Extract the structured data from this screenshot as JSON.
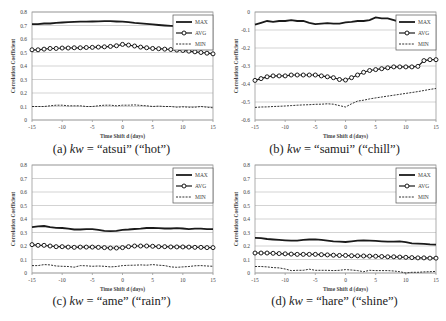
{
  "chart_data": [
    {
      "id": "a",
      "type": "line",
      "caption_prefix": "(a) ",
      "caption_kw": "kw",
      "caption_suffix": " = “atsui” (“hot”)",
      "xlabel": "Time Shift d (days)",
      "ylabel": "Correlation Coefficient",
      "ylim": [
        0,
        0.8
      ],
      "yticks": [
        "0",
        "0.1",
        "0.2",
        "0.3",
        "0.4",
        "0.5",
        "0.6",
        "0.7",
        "0.8"
      ],
      "xlim": [
        -15,
        15
      ],
      "xticks": [
        "-15",
        "-10",
        "-5",
        "0",
        "5",
        "10",
        "15"
      ],
      "legend": [
        "MAX",
        "AVG",
        "MIN"
      ],
      "x": [
        -15,
        -14,
        -13,
        -12,
        -11,
        -10,
        -9,
        -8,
        -7,
        -6,
        -5,
        -4,
        -3,
        -2,
        -1,
        0,
        1,
        2,
        3,
        4,
        5,
        6,
        7,
        8,
        9,
        10,
        11,
        12,
        13,
        14,
        15
      ],
      "series": [
        {
          "name": "MAX",
          "values": [
            0.71,
            0.71,
            0.715,
            0.715,
            0.72,
            0.722,
            0.725,
            0.727,
            0.728,
            0.729,
            0.73,
            0.731,
            0.732,
            0.732,
            0.73,
            0.728,
            0.725,
            0.72,
            0.716,
            0.712,
            0.708,
            0.704,
            0.7,
            0.697,
            0.695,
            0.695,
            0.69,
            0.685,
            0.68,
            0.675,
            0.67
          ]
        },
        {
          "name": "AVG",
          "values": [
            0.52,
            0.52,
            0.525,
            0.53,
            0.53,
            0.533,
            0.533,
            0.535,
            0.535,
            0.537,
            0.538,
            0.54,
            0.542,
            0.545,
            0.55,
            0.56,
            0.555,
            0.548,
            0.54,
            0.535,
            0.53,
            0.528,
            0.525,
            0.522,
            0.518,
            0.515,
            0.51,
            0.505,
            0.5,
            0.495,
            0.49
          ]
        },
        {
          "name": "MIN",
          "values": [
            0.1,
            0.1,
            0.1,
            0.105,
            0.11,
            0.11,
            0.105,
            0.105,
            0.105,
            0.1,
            0.1,
            0.105,
            0.11,
            0.11,
            0.105,
            0.11,
            0.11,
            0.112,
            0.108,
            0.105,
            0.1,
            0.103,
            0.1,
            0.1,
            0.095,
            0.098,
            0.095,
            0.095,
            0.1,
            0.095,
            0.09
          ]
        }
      ]
    },
    {
      "id": "b",
      "type": "line",
      "caption_prefix": "(b) ",
      "caption_kw": "kw",
      "caption_suffix": " = “samui” (“chill”)",
      "xlabel": "Time Shift d (days)",
      "ylabel": "Correlation Coefficient",
      "ylim": [
        -0.6,
        0
      ],
      "yticks": [
        "-0.6",
        "-0.5",
        "-0.4",
        "-0.3",
        "-0.2",
        "-0.1",
        "0"
      ],
      "xlim": [
        -15,
        15
      ],
      "xticks": [
        "-15",
        "-10",
        "-5",
        "0",
        "5",
        "10",
        "15"
      ],
      "legend": [
        "MAX",
        "AVG",
        "MIN"
      ],
      "x": [
        -15,
        -14,
        -13,
        -12,
        -11,
        -10,
        -9,
        -8,
        -7,
        -6,
        -5,
        -4,
        -3,
        -2,
        -1,
        0,
        1,
        2,
        3,
        4,
        5,
        6,
        7,
        8,
        9,
        10,
        11,
        12,
        13,
        14,
        15
      ],
      "series": [
        {
          "name": "MAX",
          "values": [
            -0.07,
            -0.06,
            -0.05,
            -0.055,
            -0.05,
            -0.05,
            -0.045,
            -0.05,
            -0.05,
            -0.06,
            -0.068,
            -0.065,
            -0.062,
            -0.065,
            -0.065,
            -0.058,
            -0.055,
            -0.05,
            -0.05,
            -0.045,
            -0.03,
            -0.035,
            -0.035,
            -0.045,
            -0.055,
            -0.05,
            -0.05,
            -0.045,
            -0.04,
            -0.04,
            -0.04
          ]
        },
        {
          "name": "AVG",
          "values": [
            -0.38,
            -0.37,
            -0.36,
            -0.355,
            -0.355,
            -0.355,
            -0.35,
            -0.35,
            -0.35,
            -0.35,
            -0.35,
            -0.355,
            -0.36,
            -0.365,
            -0.375,
            -0.378,
            -0.365,
            -0.35,
            -0.335,
            -0.325,
            -0.32,
            -0.315,
            -0.31,
            -0.305,
            -0.305,
            -0.305,
            -0.305,
            -0.302,
            -0.27,
            -0.265,
            -0.265
          ]
        },
        {
          "name": "MIN",
          "values": [
            -0.53,
            -0.528,
            -0.527,
            -0.525,
            -0.524,
            -0.522,
            -0.52,
            -0.518,
            -0.516,
            -0.515,
            -0.513,
            -0.512,
            -0.51,
            -0.512,
            -0.52,
            -0.528,
            -0.51,
            -0.495,
            -0.49,
            -0.483,
            -0.477,
            -0.472,
            -0.467,
            -0.462,
            -0.457,
            -0.452,
            -0.447,
            -0.442,
            -0.436,
            -0.43,
            -0.425
          ]
        }
      ]
    },
    {
      "id": "c",
      "type": "line",
      "caption_prefix": "(c) ",
      "caption_kw": "kw",
      "caption_suffix": " = “ame” (“rain”)",
      "xlabel": "Time Shift d (days)",
      "ylabel": "Correlation Coefficient",
      "ylim": [
        0,
        0.8
      ],
      "yticks": [
        "0",
        "0.1",
        "0.2",
        "0.3",
        "0.4",
        "0.5",
        "0.6",
        "0.7",
        "0.8"
      ],
      "xlim": [
        -15,
        15
      ],
      "xticks": [
        "-15",
        "-10",
        "-5",
        "0",
        "5",
        "10",
        "15"
      ],
      "legend": [
        "MAX",
        "AVG",
        "MIN"
      ],
      "x": [
        -15,
        -14,
        -13,
        -12,
        -11,
        -10,
        -9,
        -8,
        -7,
        -6,
        -5,
        -4,
        -3,
        -2,
        -1,
        0,
        1,
        2,
        3,
        4,
        5,
        6,
        7,
        8,
        9,
        10,
        11,
        12,
        13,
        14,
        15
      ],
      "series": [
        {
          "name": "MAX",
          "values": [
            0.34,
            0.345,
            0.348,
            0.34,
            0.335,
            0.333,
            0.328,
            0.322,
            0.322,
            0.325,
            0.325,
            0.32,
            0.312,
            0.31,
            0.312,
            0.32,
            0.322,
            0.326,
            0.328,
            0.333,
            0.335,
            0.332,
            0.33,
            0.33,
            0.332,
            0.33,
            0.325,
            0.328,
            0.328,
            0.325,
            0.325
          ]
        },
        {
          "name": "AVG",
          "values": [
            0.21,
            0.205,
            0.205,
            0.2,
            0.195,
            0.195,
            0.192,
            0.19,
            0.192,
            0.192,
            0.192,
            0.19,
            0.188,
            0.185,
            0.185,
            0.188,
            0.195,
            0.2,
            0.2,
            0.2,
            0.198,
            0.195,
            0.195,
            0.193,
            0.193,
            0.193,
            0.192,
            0.19,
            0.19,
            0.188,
            0.188
          ]
        },
        {
          "name": "MIN",
          "values": [
            0.055,
            0.055,
            0.062,
            0.06,
            0.052,
            0.05,
            0.048,
            0.043,
            0.055,
            0.053,
            0.05,
            0.052,
            0.05,
            0.045,
            0.048,
            0.055,
            0.057,
            0.058,
            0.06,
            0.058,
            0.062,
            0.058,
            0.055,
            0.045,
            0.042,
            0.045,
            0.048,
            0.053,
            0.055,
            0.052,
            0.05
          ]
        }
      ]
    },
    {
      "id": "d",
      "type": "line",
      "caption_prefix": "(d) ",
      "caption_kw": "kw",
      "caption_suffix": " = “hare” (“shine”)",
      "xlabel": "Time Shift d (days)",
      "ylabel": "Correlation Coefficient",
      "ylim": [
        0,
        0.8
      ],
      "yticks": [
        "0",
        "0.1",
        "0.2",
        "0.3",
        "0.4",
        "0.5",
        "0.6",
        "0.7",
        "0.8"
      ],
      "xlim": [
        -15,
        15
      ],
      "xticks": [
        "-15",
        "-10",
        "-5",
        "0",
        "5",
        "10",
        "15"
      ],
      "legend": [
        "MAX",
        "AVG",
        "MIN"
      ],
      "x": [
        -15,
        -14,
        -13,
        -12,
        -11,
        -10,
        -9,
        -8,
        -7,
        -6,
        -5,
        -4,
        -3,
        -2,
        -1,
        0,
        1,
        2,
        3,
        4,
        5,
        6,
        7,
        8,
        9,
        10,
        11,
        12,
        13,
        14,
        15
      ],
      "series": [
        {
          "name": "MAX",
          "values": [
            0.26,
            0.258,
            0.252,
            0.248,
            0.245,
            0.242,
            0.24,
            0.24,
            0.245,
            0.248,
            0.25,
            0.245,
            0.24,
            0.235,
            0.232,
            0.23,
            0.235,
            0.24,
            0.242,
            0.24,
            0.238,
            0.235,
            0.232,
            0.232,
            0.235,
            0.228,
            0.22,
            0.218,
            0.216,
            0.212,
            0.21
          ]
        },
        {
          "name": "AVG",
          "values": [
            0.148,
            0.148,
            0.148,
            0.146,
            0.144,
            0.142,
            0.14,
            0.138,
            0.138,
            0.138,
            0.138,
            0.136,
            0.134,
            0.132,
            0.13,
            0.13,
            0.128,
            0.127,
            0.126,
            0.125,
            0.124,
            0.122,
            0.12,
            0.12,
            0.118,
            0.116,
            0.114,
            0.112,
            0.112,
            0.11,
            0.11
          ]
        },
        {
          "name": "MIN",
          "values": [
            0.048,
            0.048,
            0.045,
            0.04,
            0.038,
            0.03,
            0.018,
            0.02,
            0.02,
            0.028,
            0.02,
            0.02,
            0.02,
            0.018,
            0.02,
            0.025,
            0.022,
            0.018,
            0.01,
            0.02,
            0.018,
            0.018,
            0.018,
            0.015,
            0.01,
            0.0,
            0.005,
            0.005,
            0.008,
            0.01,
            0.012
          ]
        }
      ]
    }
  ],
  "panels": [
    {
      "caption_label": "(a) kw = “atsui” (“hot”)"
    },
    {
      "caption_label": "(b) kw = “samui” (“chill”)"
    },
    {
      "caption_label": "(c) kw = “ame” (“rain”)"
    },
    {
      "caption_label": "(d) kw = “hare” (“shine”)"
    }
  ],
  "colors": {
    "line": "#1a1a1a",
    "grid": "#c8c8c8",
    "axis": "#9a9a9a",
    "text": "#444444"
  }
}
